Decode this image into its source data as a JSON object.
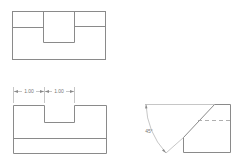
{
  "diagram": {
    "type": "orthographic-projection",
    "views": {
      "top_view": {
        "name": "top view"
      },
      "front_view": {
        "name": "front view",
        "dimensions": [
          {
            "label": "1.00",
            "from_x": 13,
            "to_x": 44
          },
          {
            "label": "1.00",
            "from_x": 44,
            "to_x": 74
          }
        ]
      },
      "side_view": {
        "name": "side view",
        "angle_label": "45°"
      }
    },
    "colors": {
      "line": "#8a8a8a",
      "background": "#ffffff"
    }
  }
}
